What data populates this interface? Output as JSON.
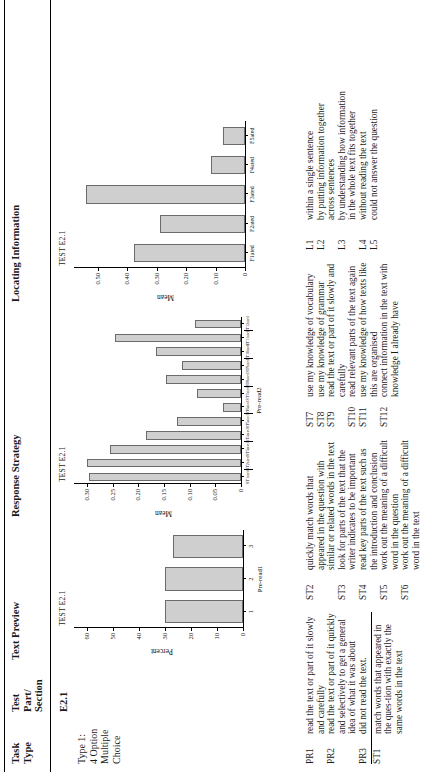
{
  "table": {
    "headers": {
      "task_type": "Task\nType",
      "test_part_section": "Test\nPart/\nSection",
      "text_preview": "Text Preview",
      "response_strategy": "Response Strategy",
      "locating_information": "Locating Information"
    },
    "row": {
      "task_type": "Type 1:\n4 Option\nMultiple\nChoice",
      "test_part_section": "E2.1"
    }
  },
  "chart_data": [
    {
      "id": "text-preview",
      "type": "bar",
      "title": "TEST E2.1",
      "xlabel": "Pre-read1",
      "ylabel": "Percent",
      "categories": [
        "1",
        "2",
        "3"
      ],
      "values": [
        30,
        30,
        27
      ],
      "ylim": [
        0,
        65
      ],
      "yticks": [
        0,
        10,
        20,
        30,
        40,
        50,
        60
      ],
      "ytick_labels": [
        "0",
        "10",
        "20",
        "30",
        "40",
        "50",
        "60"
      ],
      "grid": false,
      "legend": "none"
    },
    {
      "id": "response-strategy",
      "type": "bar",
      "title": "TEST E2.1",
      "xlabel": "Pre-read2",
      "ylabel": "Mean",
      "categories": [
        "ST1ated",
        "ST2ated",
        "ST3ated",
        "ST4ated",
        "ST5ated",
        "ST6ated",
        "ST7ated",
        "ST8ated",
        "ST9ated",
        "ST10ated",
        "ST11ated",
        "ST12ated"
      ],
      "tick_labels": [
        "ST1ated",
        "ST2ated",
        "ST3ated",
        "ST4ated",
        "ST5ated",
        "ST6ated",
        "ST7ated",
        "ST8ated",
        "ST9ated",
        "ST10ated",
        "ST11ated",
        "ST12ated"
      ],
      "values": [
        0.295,
        0.3,
        0.255,
        0.185,
        0.125,
        0.035,
        0.085,
        0.145,
        0.115,
        0.165,
        0.245,
        0.09
      ],
      "ylim": [
        0,
        0.325
      ],
      "yticks": [
        0,
        0.05,
        0.1,
        0.15,
        0.2,
        0.25,
        0.3
      ],
      "ytick_labels": [
        "0",
        "0.05",
        "0.10",
        "0.15",
        "0.20",
        "0.25",
        "0.30"
      ],
      "grid": false,
      "legend": "none"
    },
    {
      "id": "locating-information",
      "type": "bar",
      "title": "TEST E2.1",
      "xlabel": "",
      "ylabel": "Mean",
      "categories": [
        "F1ated",
        "F2ated",
        "F3ated",
        "F4ated",
        "F5ated"
      ],
      "tick_labels": [
        "F1ated",
        "F2ated",
        "F3ated",
        "F4ated",
        "F5ated"
      ],
      "values": [
        0.375,
        0.29,
        0.54,
        0.115,
        0.075
      ],
      "ylim": [
        0,
        0.58
      ],
      "yticks": [
        0,
        0.1,
        0.2,
        0.3,
        0.4,
        0.5
      ],
      "ytick_labels": [
        "0",
        "0.10",
        "0.20",
        "0.30",
        "0.40",
        "0.50"
      ],
      "grid": false,
      "legend": "none"
    }
  ],
  "legend": {
    "col1": [
      {
        "code": "PR1",
        "text": "read the text or part of it slowly and carefully"
      },
      {
        "code": "PR2",
        "text": "read the text or part of it quickly and selectively to get a general idea of what it was about"
      },
      {
        "code": "PR3",
        "text": "did not read the text."
      },
      {
        "code": "ST1",
        "text": "match words that appeared in the ques-tion with exactly the same words in the text"
      }
    ],
    "col2": [
      {
        "code": "ST2",
        "text": "quickly match words that appeared in the question with similar or related words in the text"
      },
      {
        "code": "ST3",
        "text": "look for parts of the text that the writer indicates to be important"
      },
      {
        "code": "ST4",
        "text": "read key parts of the text such as the introduction and conclusion"
      },
      {
        "code": "ST5",
        "text": "work out the meaning of a difficult word in the question"
      },
      {
        "code": "ST6",
        "text": "work out the meaning of a difficult word in the text"
      }
    ],
    "col3": [
      {
        "code": "ST7",
        "text": "use my knowledge of vocabulary"
      },
      {
        "code": "ST8",
        "text": "use my knowledge of grammar"
      },
      {
        "code": "ST9",
        "text": "read the text or part of it slowly and carefully"
      },
      {
        "code": "ST10",
        "text": "read relevant parts of the text again"
      },
      {
        "code": "ST11",
        "text": "use my knowledge of how texts like this are organised"
      },
      {
        "code": "ST12",
        "text": "connect information in the text with knowledge I already have"
      }
    ],
    "col4": [
      {
        "code": "L1",
        "text": "within a single sentence"
      },
      {
        "code": "L2",
        "text": "by putting information together across sentences"
      },
      {
        "code": "L3",
        "text": "by understanding how information in the whole text fits together"
      },
      {
        "code": "L4",
        "text": "without reading the text"
      },
      {
        "code": "L5",
        "text": "could not answer the question"
      }
    ]
  }
}
